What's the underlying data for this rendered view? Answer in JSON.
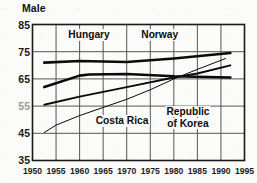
{
  "chart_data": {
    "type": "line",
    "title": "Male",
    "xlabel": "",
    "ylabel": "",
    "xlim": [
      1950,
      1995
    ],
    "ylim": [
      35,
      85
    ],
    "x_ticks": [
      1950,
      1955,
      1960,
      1965,
      1970,
      1975,
      1980,
      1985,
      1990,
      1995
    ],
    "y_ticks": [
      35,
      45,
      55,
      65,
      75,
      85
    ],
    "grid": true,
    "legend_position": "inline-annotations",
    "annotations": [
      {
        "text": "Hungary",
        "x": 1962,
        "y": 81
      },
      {
        "text": "Norway",
        "x": 1977,
        "y": 81
      },
      {
        "text": "Costa Rica",
        "x": 1969,
        "y": 49.5
      },
      {
        "text": "Republic",
        "x": 1983,
        "y": 53
      },
      {
        "text": "of Korea",
        "x": 1983,
        "y": 48.5
      }
    ],
    "series": [
      {
        "name": "Norway",
        "style": "thick",
        "points": [
          [
            1952.5,
            71.0
          ],
          [
            1960,
            71.6
          ],
          [
            1970,
            71.2
          ],
          [
            1980,
            72.5
          ],
          [
            1992,
            74.5
          ]
        ]
      },
      {
        "name": "Hungary",
        "style": "thick",
        "points": [
          [
            1952.5,
            62.0
          ],
          [
            1960,
            66.2
          ],
          [
            1962,
            66.6
          ],
          [
            1970,
            66.8
          ],
          [
            1980,
            66.0
          ],
          [
            1992,
            65.5
          ]
        ]
      },
      {
        "name": "Republic of Korea",
        "style": "medium",
        "points": [
          [
            1952.5,
            55.5
          ],
          [
            1960,
            58.5
          ],
          [
            1970,
            62.0
          ],
          [
            1980,
            65.5
          ],
          [
            1985,
            67.0
          ],
          [
            1992,
            70.0
          ]
        ]
      },
      {
        "name": "Costa Rica",
        "style": "thin",
        "points": [
          [
            1952.5,
            45.3
          ],
          [
            1955,
            48.0
          ],
          [
            1960,
            51.5
          ],
          [
            1965,
            54.5
          ],
          [
            1970,
            57.5
          ],
          [
            1975,
            61.0
          ],
          [
            1980,
            65.0
          ],
          [
            1985,
            68.5
          ],
          [
            1991,
            72.5
          ]
        ]
      }
    ]
  },
  "axis": {
    "y_labels": [
      "85",
      "75",
      "65",
      "55",
      "45",
      "35"
    ],
    "x_labels": [
      "1950",
      "1955",
      "1960",
      "1965",
      "1970",
      "1975",
      "1980",
      "1985",
      "1990",
      "1995"
    ]
  },
  "labels": {
    "title": "Male",
    "hungary": "Hungary",
    "norway": "Norway",
    "costa_rica": "Costa Rica",
    "korea_line1": "Republic",
    "korea_line2": "of Korea"
  },
  "colors": {
    "line": "#0a0a0a",
    "grid": "#555555",
    "frame": "#1a1a1a",
    "text": "#121212",
    "background": "#fbfbfa"
  }
}
